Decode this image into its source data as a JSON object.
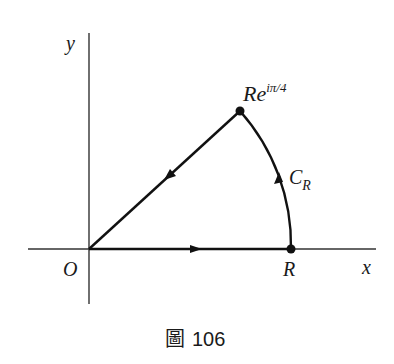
{
  "figure": {
    "caption_char": "圖",
    "caption_number": "106"
  },
  "axes": {
    "x_label": "x",
    "y_label": "y",
    "origin_label": "O"
  },
  "points": {
    "R_label": "R",
    "top_label_base": "Re",
    "top_label_exp": "iπ/4"
  },
  "contour": {
    "arc_label_base": "C",
    "arc_label_sub": "R"
  },
  "colors": {
    "ink": "#1a1a1a",
    "axis": "#333333",
    "background": "#ffffff"
  }
}
